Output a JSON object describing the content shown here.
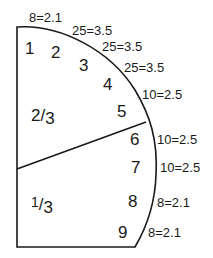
{
  "diagram": {
    "stroke_color": "#1a1a1a",
    "regions": [
      {
        "id": "1",
        "label": "1"
      },
      {
        "id": "2",
        "label": "2"
      },
      {
        "id": "3",
        "label": "3"
      },
      {
        "id": "4",
        "label": "4"
      },
      {
        "id": "5",
        "label": "5"
      },
      {
        "id": "6",
        "label": "6"
      },
      {
        "id": "7",
        "label": "7"
      },
      {
        "id": "8",
        "label": "8"
      },
      {
        "id": "9",
        "label": "9"
      }
    ],
    "fractions": {
      "upper": {
        "num": "2",
        "den": "3"
      },
      "lower": {
        "num": "1",
        "den": "3"
      }
    },
    "measurements": [
      "8=2.1",
      "25=3.5",
      "25=3.5",
      "25=3.5",
      "10=2.5",
      "10=2.5",
      "10=2.5",
      "8=2.1",
      "8=2.1"
    ]
  }
}
